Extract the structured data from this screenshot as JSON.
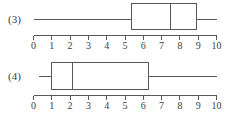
{
  "figure": {
    "background_color": "#ffffff",
    "line_color": "#58585a",
    "text_color": "#3d3d3d"
  },
  "chart_data": {
    "type": "boxplot",
    "title": "",
    "xlabel": "",
    "ylabel": "",
    "xlim": [
      0,
      10
    ],
    "grid": false,
    "legend": "none",
    "orientation": "horizontal",
    "axis_ticks": [
      0,
      1,
      2,
      3,
      4,
      5,
      6,
      7,
      8,
      9,
      10
    ],
    "axis_tick_labels": [
      "0",
      "1",
      "2",
      "3",
      "4",
      "5",
      "6",
      "7",
      "8",
      "9",
      "10"
    ],
    "boxes": [
      {
        "label": "(3)",
        "whisker_low": 0.05,
        "q1": 5.35,
        "median": 7.5,
        "q3": 8.9,
        "whisker_high": 10.0
      },
      {
        "label": "(4)",
        "whisker_low": 0.3,
        "q1": 1.0,
        "median": 2.15,
        "q3": 6.3,
        "whisker_high": 10.0
      }
    ]
  },
  "plots": {
    "plot3": {
      "label": "(3)",
      "ticks": [
        "0",
        "1",
        "2",
        "3",
        "4",
        "5",
        "6",
        "7",
        "8",
        "9",
        "10"
      ]
    },
    "plot4": {
      "label": "(4)",
      "ticks": [
        "0",
        "1",
        "2",
        "3",
        "4",
        "5",
        "6",
        "7",
        "8",
        "9",
        "10"
      ]
    }
  }
}
